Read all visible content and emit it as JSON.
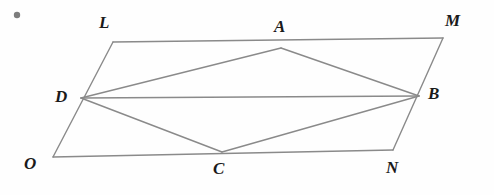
{
  "figure": {
    "width": 494,
    "height": 195,
    "background_color": "#fefefe",
    "line_color": "#8a8a8a",
    "label_color": "#1a1a1a",
    "line_width": 1.4,
    "marker": {
      "name": "corner-dot",
      "color": "#7d7d7d",
      "cx": 17,
      "cy": 15,
      "r": 3.2
    },
    "vertices": [
      {
        "id": "L",
        "label": "L",
        "x": 113,
        "y": 42,
        "label_x": 99,
        "label_y": 14
      },
      {
        "id": "A",
        "label": "A",
        "x": 281,
        "y": 48,
        "label_x": 274,
        "label_y": 18
      },
      {
        "id": "M",
        "label": "M",
        "x": 443,
        "y": 38,
        "label_x": 445,
        "label_y": 12
      },
      {
        "id": "D",
        "label": "D",
        "x": 81,
        "y": 98,
        "label_x": 55,
        "label_y": 88
      },
      {
        "id": "B",
        "label": "B",
        "x": 419,
        "y": 96,
        "label_x": 428,
        "label_y": 85
      },
      {
        "id": "O",
        "label": "O",
        "x": 53,
        "y": 157,
        "label_x": 24,
        "label_y": 155
      },
      {
        "id": "C",
        "label": "C",
        "x": 222,
        "y": 152,
        "label_x": 213,
        "label_y": 160
      },
      {
        "id": "N",
        "label": "N",
        "x": 393,
        "y": 150,
        "label_x": 386,
        "label_y": 159
      }
    ],
    "segments": [
      {
        "name": "side-LM",
        "from": "L",
        "to": "M"
      },
      {
        "name": "side-MN",
        "from": "M",
        "to": "N"
      },
      {
        "name": "side-NO",
        "from": "N",
        "to": "O"
      },
      {
        "name": "side-OL",
        "from": "O",
        "to": "L"
      },
      {
        "name": "segment-DA",
        "from": "D",
        "to": "A"
      },
      {
        "name": "segment-AB",
        "from": "A",
        "to": "B"
      },
      {
        "name": "segment-BC",
        "from": "B",
        "to": "C"
      },
      {
        "name": "segment-CD",
        "from": "C",
        "to": "D"
      },
      {
        "name": "diagonal-DB",
        "from": "D",
        "to": "B"
      }
    ]
  }
}
